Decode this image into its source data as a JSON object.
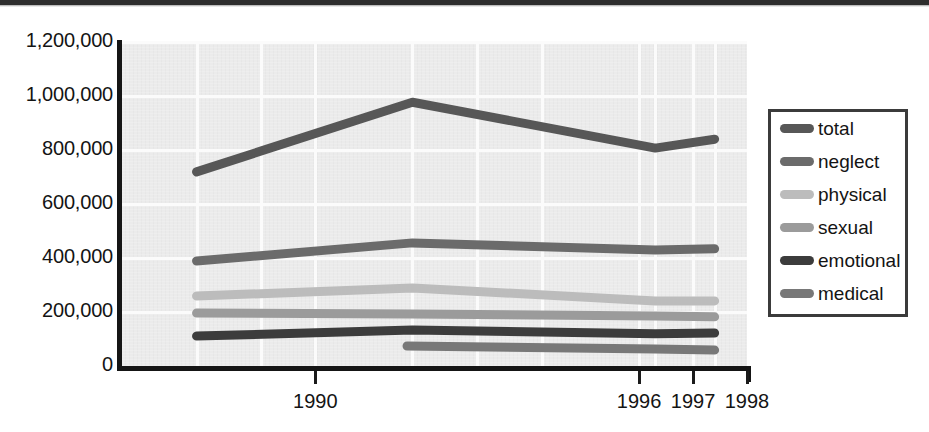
{
  "chart_data": {
    "type": "line",
    "title": "",
    "subtitle": "",
    "xlabel": "",
    "ylabel": "",
    "xlim": [
      1986.4,
      1998.0
    ],
    "ylim": [
      0,
      1200000
    ],
    "grid": true,
    "legend_position": "right",
    "x_tick_labels": [
      "1990",
      "1996",
      "1997",
      "1998"
    ],
    "x_tick_values": [
      1990,
      1996,
      1997,
      1998
    ],
    "y_tick_labels": [
      "0",
      "200,000",
      "400,000",
      "600,000",
      "800,000",
      "1,000,000",
      "1,200,000"
    ],
    "y_tick_values": [
      0,
      200000,
      400000,
      600000,
      800000,
      1000000,
      1200000
    ],
    "x": [
      1987.8,
      1991.8,
      1996.3,
      1997.4
    ],
    "series": [
      {
        "name": "total",
        "color": "#575757",
        "x": [
          1987.8,
          1991.8,
          1996.3,
          1997.4
        ],
        "values": [
          719000,
          977000,
          807000,
          840000
        ]
      },
      {
        "name": "neglect",
        "color": "#6b6b6b",
        "x": [
          1987.8,
          1991.8,
          1996.3,
          1997.4
        ],
        "values": [
          389000,
          456000,
          430000,
          434000
        ]
      },
      {
        "name": "physical",
        "color": "#bcbcbc",
        "x": [
          1987.8,
          1991.8,
          1996.3,
          1997.4
        ],
        "values": [
          259000,
          289000,
          241000,
          241000
        ]
      },
      {
        "name": "sexual",
        "color": "#9b9b9b",
        "x": [
          1987.8,
          1991.8,
          1996.3,
          1997.4
        ],
        "values": [
          196000,
          193000,
          185000,
          182000
        ]
      },
      {
        "name": "emotional",
        "color": "#3c3c3c",
        "x": [
          1987.8,
          1991.8,
          1996.3,
          1997.4
        ],
        "values": [
          111000,
          133000,
          119000,
          122000
        ]
      },
      {
        "name": "medical",
        "color": "#787878",
        "x": [
          1991.7,
          1996.3,
          1997.4
        ],
        "values": [
          74000,
          63000,
          59000
        ]
      }
    ]
  },
  "axes": {
    "y_labels": [
      "1,200,000",
      "1,000,000",
      "800,000",
      "600,000",
      "400,000",
      "200,000",
      "0"
    ],
    "x_labels": [
      "1990",
      "1996",
      "1997",
      "1998"
    ]
  },
  "legend": {
    "items": [
      {
        "label": "total",
        "color": "#575757"
      },
      {
        "label": "neglect",
        "color": "#6b6b6b"
      },
      {
        "label": "physical",
        "color": "#bcbcbc"
      },
      {
        "label": "sexual",
        "color": "#9b9b9b"
      },
      {
        "label": "emotional",
        "color": "#3c3c3c"
      },
      {
        "label": "medical",
        "color": "#787878"
      }
    ]
  }
}
